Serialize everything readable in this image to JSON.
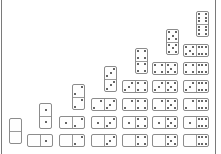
{
  "board": {
    "title": "Double-six domino triangle",
    "border_color": "#7a7a7a",
    "pip_color": "#333333",
    "dominoes": [
      {
        "a": 0,
        "b": 0,
        "orient": "v",
        "x": 8,
        "y": 118
      },
      {
        "a": 0,
        "b": 1,
        "orient": "h",
        "x": 26,
        "y": 134
      },
      {
        "a": 1,
        "b": 1,
        "orient": "v",
        "x": 38,
        "y": 103
      },
      {
        "a": 0,
        "b": 2,
        "orient": "h",
        "x": 58,
        "y": 134
      },
      {
        "a": 1,
        "b": 2,
        "orient": "h",
        "x": 58,
        "y": 116
      },
      {
        "a": 2,
        "b": 2,
        "orient": "v",
        "x": 71,
        "y": 84
      },
      {
        "a": 0,
        "b": 3,
        "orient": "h",
        "x": 90,
        "y": 134
      },
      {
        "a": 1,
        "b": 3,
        "orient": "h",
        "x": 90,
        "y": 116
      },
      {
        "a": 2,
        "b": 3,
        "orient": "h",
        "x": 90,
        "y": 98
      },
      {
        "a": 3,
        "b": 3,
        "orient": "v",
        "x": 103,
        "y": 66
      },
      {
        "a": 0,
        "b": 4,
        "orient": "h",
        "x": 121,
        "y": 134
      },
      {
        "a": 1,
        "b": 4,
        "orient": "h",
        "x": 121,
        "y": 116
      },
      {
        "a": 2,
        "b": 4,
        "orient": "h",
        "x": 121,
        "y": 98
      },
      {
        "a": 3,
        "b": 4,
        "orient": "h",
        "x": 121,
        "y": 80
      },
      {
        "a": 4,
        "b": 4,
        "orient": "v",
        "x": 134,
        "y": 48
      },
      {
        "a": 0,
        "b": 5,
        "orient": "h",
        "x": 151,
        "y": 134
      },
      {
        "a": 1,
        "b": 5,
        "orient": "h",
        "x": 151,
        "y": 116
      },
      {
        "a": 2,
        "b": 5,
        "orient": "h",
        "x": 151,
        "y": 98
      },
      {
        "a": 3,
        "b": 5,
        "orient": "h",
        "x": 151,
        "y": 80
      },
      {
        "a": 4,
        "b": 5,
        "orient": "h",
        "x": 151,
        "y": 62
      },
      {
        "a": 5,
        "b": 5,
        "orient": "v",
        "x": 165,
        "y": 29
      },
      {
        "a": 0,
        "b": 6,
        "orient": "h",
        "x": 182,
        "y": 134
      },
      {
        "a": 1,
        "b": 6,
        "orient": "h",
        "x": 182,
        "y": 116
      },
      {
        "a": 2,
        "b": 6,
        "orient": "h",
        "x": 182,
        "y": 98
      },
      {
        "a": 3,
        "b": 6,
        "orient": "h",
        "x": 182,
        "y": 80
      },
      {
        "a": 4,
        "b": 6,
        "orient": "h",
        "x": 182,
        "y": 62
      },
      {
        "a": 5,
        "b": 6,
        "orient": "h",
        "x": 182,
        "y": 44
      },
      {
        "a": 6,
        "b": 6,
        "orient": "v",
        "x": 195,
        "y": 11
      }
    ]
  }
}
